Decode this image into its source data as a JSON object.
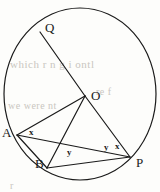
{
  "figure": {
    "type": "circle-geometry-diagram",
    "background_color": "#fdfdfb",
    "stroke_color": "#1a1a1a",
    "label_color": "#1a1a1a",
    "ghost_color": "#c9c6c0",
    "canvas": {
      "width": 160,
      "height": 192
    },
    "circle": {
      "name": "main-circle",
      "center_x": 80,
      "center_y": 94,
      "radius_x": 76,
      "radius_y": 86
    },
    "points": [
      {
        "id": "Q",
        "label": "Q",
        "x": 40,
        "y": 32,
        "label_x": 45,
        "label_y": 21
      },
      {
        "id": "O",
        "label": "O",
        "x": 85,
        "y": 96,
        "label_x": 91,
        "label_y": 89
      },
      {
        "id": "A",
        "label": "A",
        "x": 17,
        "y": 135,
        "label_x": 2,
        "label_y": 126
      },
      {
        "id": "B",
        "label": "B",
        "x": 47,
        "y": 168,
        "label_x": 35,
        "label_y": 157
      },
      {
        "id": "P",
        "label": "P",
        "x": 130,
        "y": 157,
        "label_x": 136,
        "label_y": 156
      }
    ],
    "segments": [
      {
        "id": "QO",
        "from": "Q",
        "to": "O"
      },
      {
        "id": "OP",
        "from": "O",
        "to": "P"
      },
      {
        "id": "OA",
        "from": "O",
        "to": "A"
      },
      {
        "id": "OB",
        "from": "O",
        "to": "B"
      },
      {
        "id": "AP",
        "from": "A",
        "to": "P"
      },
      {
        "id": "AB",
        "from": "A",
        "to": "B"
      },
      {
        "id": "BP",
        "from": "B",
        "to": "P"
      }
    ],
    "angle_labels": [
      {
        "id": "angle-x-at-A",
        "text": "x",
        "x": 29,
        "y": 128
      },
      {
        "id": "angle-y-at-B",
        "text": "y",
        "x": 67,
        "y": 148
      },
      {
        "id": "angle-y-at-P",
        "text": "y",
        "x": 104,
        "y": 143
      },
      {
        "id": "angle-x-at-P",
        "text": "x",
        "x": 115,
        "y": 142
      }
    ],
    "ghost_lines": [
      {
        "id": "ghost-line-1",
        "text": "which r n g i ontl",
        "x": 10,
        "y": 58,
        "size": 11
      },
      {
        "id": "ghost-line-2",
        "text": "we were nt",
        "x": 8,
        "y": 100,
        "size": 10
      },
      {
        "id": "ghost-line-3",
        "text": "re f",
        "x": 96,
        "y": 86,
        "size": 10
      },
      {
        "id": "ghost-line-4",
        "text": "r",
        "x": 10,
        "y": 180,
        "size": 10
      }
    ]
  }
}
